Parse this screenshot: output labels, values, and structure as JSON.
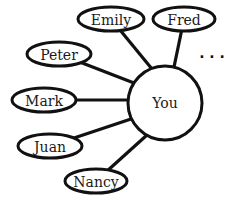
{
  "diagram": {
    "center": {
      "label": "You",
      "cx": 165,
      "cy": 103,
      "r": 37
    },
    "friends": [
      {
        "label": "Emily",
        "cx": 111,
        "cy": 19,
        "rx": 33,
        "ry": 12,
        "ex": 152,
        "ey": 69
      },
      {
        "label": "Fred",
        "cx": 184,
        "cy": 19,
        "rx": 31,
        "ry": 12,
        "ex": 174,
        "ey": 67
      },
      {
        "label": "Peter",
        "cx": 59,
        "cy": 54,
        "rx": 32,
        "ry": 12,
        "ex": 134,
        "ey": 83
      },
      {
        "label": "Mark",
        "cx": 44,
        "cy": 100,
        "rx": 32,
        "ry": 12,
        "ex": 128,
        "ey": 100
      },
      {
        "label": "Juan",
        "cx": 50,
        "cy": 146,
        "rx": 32,
        "ry": 12,
        "ex": 131,
        "ey": 119
      },
      {
        "label": "Nancy",
        "cx": 96,
        "cy": 181,
        "rx": 31,
        "ry": 12,
        "ex": 147,
        "ey": 135
      }
    ],
    "ellipsis": "· · ·"
  }
}
